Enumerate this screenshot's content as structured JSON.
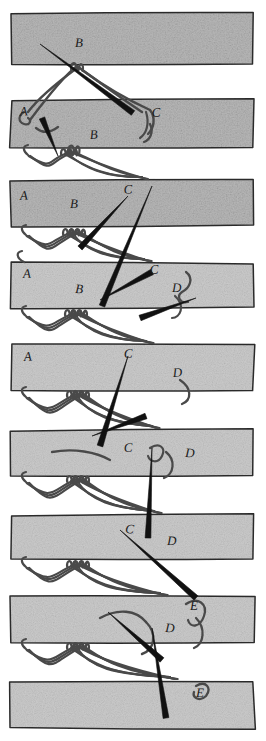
{
  "figure": {
    "type": "hand-drawn instructional diagram",
    "medium": "pen and ink line drawing with pencil-shaded straps",
    "width": 266,
    "height": 741,
    "background_color": "#ffffff",
    "ink_color": "#1a1a1a",
    "strap_fill": "#b9b9b9",
    "strap_fill_light": "#cccccc",
    "strap_edge_color": "#2b2b2b",
    "thread_color": "#4a4a4a",
    "needle_color": "#111111",
    "label_count": 23,
    "panel_count": 9
  },
  "straps": [
    {
      "id": "strap-1",
      "x": 11,
      "y": 14,
      "w": 243,
      "h": 51,
      "tone": "dark"
    },
    {
      "id": "strap-2",
      "x": 11,
      "y": 100,
      "w": 243,
      "h": 47,
      "tone": "dark"
    },
    {
      "id": "strap-3",
      "x": 11,
      "y": 181,
      "w": 243,
      "h": 45,
      "tone": "dark"
    },
    {
      "id": "strap-4",
      "x": 11,
      "y": 263,
      "w": 243,
      "h": 45,
      "tone": "light"
    },
    {
      "id": "strap-5",
      "x": 11,
      "y": 345,
      "w": 243,
      "h": 45,
      "tone": "light"
    },
    {
      "id": "strap-6",
      "x": 11,
      "y": 430,
      "w": 243,
      "h": 45,
      "tone": "light"
    },
    {
      "id": "strap-7",
      "x": 11,
      "y": 515,
      "w": 243,
      "h": 45,
      "tone": "light"
    },
    {
      "id": "strap-8",
      "x": 11,
      "y": 597,
      "w": 243,
      "h": 45,
      "tone": "light"
    },
    {
      "id": "strap-9",
      "x": 11,
      "y": 681,
      "w": 243,
      "h": 47,
      "tone": "light"
    }
  ],
  "labels": [
    {
      "text": "B",
      "x": 75,
      "y": 47,
      "panel": 1
    },
    {
      "text": "A",
      "x": 20,
      "y": 116,
      "panel": 2
    },
    {
      "text": "C",
      "x": 152,
      "y": 117,
      "panel": 2
    },
    {
      "text": "B",
      "x": 90,
      "y": 139,
      "panel": 2
    },
    {
      "text": "A",
      "x": 20,
      "y": 200,
      "panel": 3
    },
    {
      "text": "C",
      "x": 124,
      "y": 194,
      "panel": 3
    },
    {
      "text": "B",
      "x": 70,
      "y": 208,
      "panel": 3
    },
    {
      "text": "A",
      "x": 23,
      "y": 278,
      "panel": 4
    },
    {
      "text": "C",
      "x": 150,
      "y": 274,
      "panel": 4
    },
    {
      "text": "B",
      "x": 75,
      "y": 293,
      "panel": 4
    },
    {
      "text": "D",
      "x": 172,
      "y": 292,
      "panel": 4
    },
    {
      "text": "A",
      "x": 24,
      "y": 361,
      "panel": 5
    },
    {
      "text": "C",
      "x": 124,
      "y": 358,
      "panel": 5
    },
    {
      "text": "D",
      "x": 173,
      "y": 377,
      "panel": 5
    },
    {
      "text": "C",
      "x": 124,
      "y": 452,
      "panel": 6
    },
    {
      "text": "D",
      "x": 185,
      "y": 457,
      "panel": 6
    },
    {
      "text": "C",
      "x": 125,
      "y": 533,
      "panel": 7
    },
    {
      "text": "D",
      "x": 167,
      "y": 545,
      "panel": 7
    },
    {
      "text": "E",
      "x": 190,
      "y": 610,
      "panel": 8
    },
    {
      "text": "D",
      "x": 165,
      "y": 632,
      "panel": 8
    },
    {
      "text": "E",
      "x": 196,
      "y": 697,
      "panel": 9
    }
  ],
  "legend": {
    "letters": [
      "A",
      "B",
      "C",
      "D",
      "E"
    ],
    "meaning": "lacing hole positions along the strap edge"
  }
}
